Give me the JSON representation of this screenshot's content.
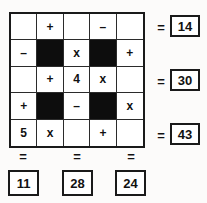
{
  "puzzle": {
    "type": "arithmetic-grid-puzzle",
    "rows": 5,
    "cols": 5,
    "cells": [
      {
        "text": "",
        "black": false
      },
      {
        "text": "+",
        "black": false
      },
      {
        "text": "",
        "black": false
      },
      {
        "text": "–",
        "black": false
      },
      {
        "text": "",
        "black": false
      },
      {
        "text": "–",
        "black": false
      },
      {
        "text": "",
        "black": true
      },
      {
        "text": "x",
        "black": false
      },
      {
        "text": "",
        "black": true
      },
      {
        "text": "+",
        "black": false
      },
      {
        "text": "",
        "black": false
      },
      {
        "text": "+",
        "black": false
      },
      {
        "text": "4",
        "black": false
      },
      {
        "text": "x",
        "black": false
      },
      {
        "text": "",
        "black": false
      },
      {
        "text": "+",
        "black": false
      },
      {
        "text": "",
        "black": true
      },
      {
        "text": "–",
        "black": false
      },
      {
        "text": "",
        "black": true
      },
      {
        "text": "x",
        "black": false
      },
      {
        "text": "5",
        "black": false
      },
      {
        "text": "x",
        "black": false
      },
      {
        "text": "",
        "black": false
      },
      {
        "text": "+",
        "black": false
      },
      {
        "text": "",
        "black": false
      }
    ],
    "row_results": [
      {
        "equals": "=",
        "value": "14"
      },
      {
        "equals": "=",
        "value": "30"
      },
      {
        "equals": "=",
        "value": "43"
      }
    ],
    "col_results": [
      {
        "equals": "=",
        "value": "11"
      },
      {
        "equals": "=",
        "value": "28"
      },
      {
        "equals": "=",
        "value": "24"
      }
    ],
    "colors": {
      "grid_border": "#1a1a1a",
      "cell_line": "#2b2b2b",
      "blocked_cell": "#0d0d0d",
      "text": "#111111",
      "page_background": "#fcfbfa"
    }
  }
}
